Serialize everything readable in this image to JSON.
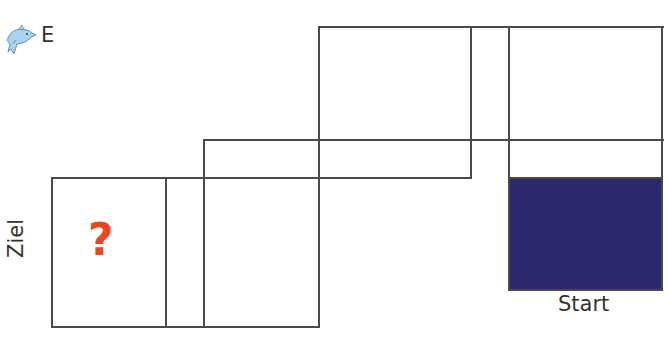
{
  "diagram": {
    "type": "cube-net-path",
    "header": {
      "icon": "dolphin-icon",
      "label": "E"
    },
    "goal_label": "Ziel",
    "start_label": "Start",
    "unknown_symbol": "?",
    "colors": {
      "line": "#4a4a4a",
      "start_fill": "#2b2a6e",
      "question_mark": "#ee4422"
    },
    "cells": [
      {
        "id": "ziel-cell",
        "content": "?"
      },
      {
        "id": "narrow-strip-left"
      },
      {
        "id": "lower-middle-cell"
      },
      {
        "id": "upper-middle-strip"
      },
      {
        "id": "top-cell"
      },
      {
        "id": "top-narrow-strip"
      },
      {
        "id": "top-right-cell"
      },
      {
        "id": "right-strip"
      },
      {
        "id": "start-cell",
        "filled": true
      }
    ]
  }
}
